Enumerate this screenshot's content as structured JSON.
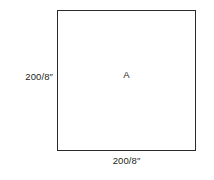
{
  "figure": {
    "background_color": "#ffffff",
    "shape": {
      "kind": "square",
      "stroke_color": "#2b2b2b",
      "fill_color": "#ffffff",
      "interior_label": "A"
    },
    "dimensions": {
      "height_label": "200/8″",
      "width_label": "200/8″"
    }
  }
}
